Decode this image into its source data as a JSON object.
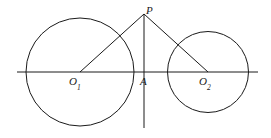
{
  "figure": {
    "type": "geometry-diagram",
    "width": 271,
    "height": 138,
    "background_color": "#ffffff",
    "stroke_color": "#1a1a1a",
    "stroke_width": 1
  },
  "labels": {
    "apex": "P",
    "left_center": "O",
    "left_center_sub": "1",
    "foot": "A",
    "right_center": "O",
    "right_center_sub": "2"
  },
  "points": {
    "P": {
      "x": 144,
      "y": 14,
      "name": "P"
    },
    "O1": {
      "x": 80,
      "y": 72,
      "name": "O1"
    },
    "A": {
      "x": 144,
      "y": 72,
      "name": "A"
    },
    "O2": {
      "x": 208,
      "y": 72,
      "name": "O2"
    }
  },
  "circles": [
    {
      "name": "left-circle",
      "cx": 80,
      "cy": 72,
      "r": 54
    },
    {
      "name": "right-circle",
      "cx": 208,
      "cy": 72,
      "r": 40.5
    }
  ],
  "segments": [
    {
      "name": "baseline",
      "x1": 17,
      "y1": 72,
      "x2": 258,
      "y2": 72
    },
    {
      "name": "vertical-axis",
      "x1": 144,
      "y1": 14,
      "x2": 144,
      "y2": 128
    },
    {
      "name": "segment-P-O1",
      "x1": 144,
      "y1": 14,
      "x2": 80,
      "y2": 72
    },
    {
      "name": "segment-P-O2",
      "x1": 144,
      "y1": 14,
      "x2": 208,
      "y2": 72
    }
  ]
}
